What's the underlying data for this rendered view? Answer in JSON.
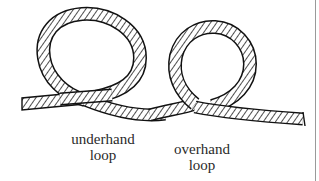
{
  "figure": {
    "labels": {
      "underhand": {
        "line1": "underhand",
        "line2": "loop"
      },
      "overhand": {
        "line1": "overhand",
        "line2": "loop"
      }
    },
    "colors": {
      "rope_outline": "#111111",
      "rope_hatch": "#222222",
      "rope_fill": "#ffffff",
      "text": "#2a2a2a",
      "edge_line": "#9a9a9a",
      "background": "#ffffff"
    }
  }
}
